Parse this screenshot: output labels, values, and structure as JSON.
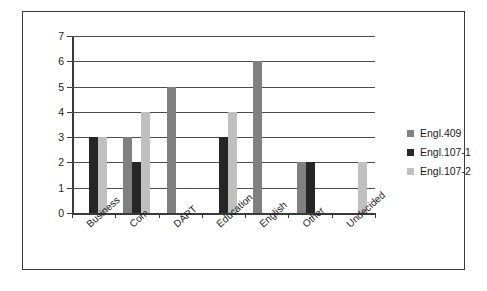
{
  "chart_data": {
    "type": "bar",
    "title": "",
    "subtitle": "",
    "xlabel": "",
    "ylabel": "",
    "ylim": [
      0,
      7
    ],
    "ytick_labels": [
      "0",
      "1",
      "2",
      "3",
      "4",
      "5",
      "6",
      "7"
    ],
    "grid": true,
    "legend_position": "right",
    "categories": [
      "Business",
      "Com",
      "DART",
      "Education",
      "English",
      "Other",
      "Undecided"
    ],
    "series": [
      {
        "name": "Engl.409",
        "color": "#808080",
        "values": [
          0,
          3,
          5,
          0,
          6,
          2,
          0
        ]
      },
      {
        "name": "Engl.107-1",
        "color": "#262626",
        "values": [
          3,
          2,
          0,
          3,
          0,
          2,
          0
        ]
      },
      {
        "name": "Engl.107-2",
        "color": "#c0c0c0",
        "values": [
          3,
          4,
          0,
          4,
          0,
          0,
          2
        ]
      }
    ]
  },
  "legend": {
    "items": [
      {
        "label": "Engl.409"
      },
      {
        "label": "Engl.107-1"
      },
      {
        "label": "Engl.107-2"
      }
    ]
  },
  "colors": {
    "series_409": "#808080",
    "series_107_1": "#262626",
    "series_107_2": "#c0c0c0",
    "frame_border": "#3a3a3a",
    "gridline": "#4c4c4c",
    "text": "#1a1a1a",
    "background": "#ffffff"
  }
}
